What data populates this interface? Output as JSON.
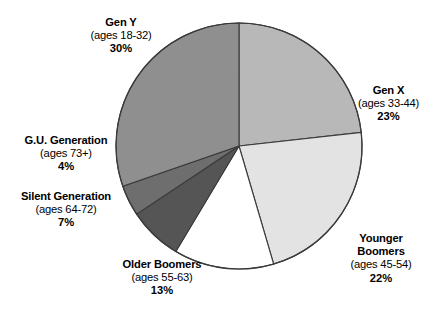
{
  "chart_data": {
    "type": "pie",
    "title": "",
    "subtitle": "",
    "xlabel": "",
    "ylabel": "",
    "legend_position": "callout-labels",
    "grid": false,
    "start_angle_deg": 0,
    "direction": "clockwise",
    "categories": [
      "Gen X",
      "Younger Boomers",
      "Older Boomers",
      "Silent Generation",
      "G.U. Generation",
      "Gen Y"
    ],
    "values": [
      23,
      22,
      13,
      7,
      4,
      30
    ],
    "slices": [
      {
        "name": "Gen X",
        "ages": "(ages 33-44)",
        "percent": 23,
        "percent_label": "23%",
        "color": "#b8b8b8"
      },
      {
        "name": "Younger Boomers",
        "ages": "(ages 45-54)",
        "percent": 22,
        "percent_label": "22%",
        "color": "#e3e3e3"
      },
      {
        "name": "Older Boomers",
        "ages": "(ages 55-63)",
        "percent": 13,
        "percent_label": "13%",
        "color": "#ffffff"
      },
      {
        "name": "Silent Generation",
        "ages": "(ages 64-72)",
        "percent": 7,
        "percent_label": "7%",
        "color": "#555555"
      },
      {
        "name": "G.U. Generation",
        "ages": "(ages 73+)",
        "percent": 4,
        "percent_label": "4%",
        "color": "#6e6e6e"
      },
      {
        "name": "Gen Y",
        "ages": "(ages 18-32)",
        "percent": 30,
        "percent_label": "30%",
        "color": "#8f8f8f"
      }
    ]
  },
  "labels": {
    "geny": {
      "name": "Gen Y",
      "ages": "(ages 18-32)",
      "percent": "30%"
    },
    "genx": {
      "name": "Gen X",
      "ages": "(ages 33-44)",
      "percent": "23%"
    },
    "gu": {
      "name": "G.U. Generation",
      "ages": "(ages 73+)",
      "percent": "4%"
    },
    "silent": {
      "name": "Silent Generation",
      "ages": "(ages 64-72)",
      "percent": "7%"
    },
    "older": {
      "name": "Older Boomers",
      "ages": "(ages 55-63)",
      "percent": "13%"
    },
    "younger": {
      "name": "Younger Boomers",
      "ages_line1": "Younger",
      "ages_line2": "Boomers",
      "ages": "(ages 45-54)",
      "percent": "22%"
    }
  },
  "colors": {
    "outline": "#3a3a3a",
    "background": "#ffffff",
    "text": "#000000"
  }
}
